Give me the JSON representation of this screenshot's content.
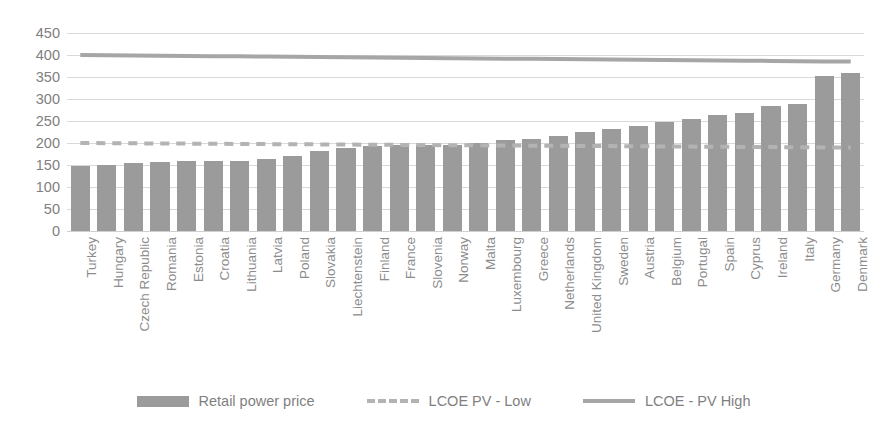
{
  "chart_data": {
    "type": "bar",
    "title": "",
    "subtitle": "",
    "xlabel": "",
    "ylabel": "",
    "ylim": [
      0,
      450
    ],
    "ytick_step": 50,
    "yticks": [
      450,
      400,
      350,
      300,
      250,
      200,
      150,
      100,
      50,
      0
    ],
    "grid": true,
    "legend_position": "bottom",
    "categories": [
      "Turkey",
      "Hungary",
      "Czech Republic",
      "Romania",
      "Estonia",
      "Croatia",
      "Lithuania",
      "Latvia",
      "Poland",
      "Slovakia",
      "Liechtenstein",
      "Finland",
      "France",
      "Slovenia",
      "Norway",
      "Malta",
      "Luxembourg",
      "Greece",
      "Netherlands",
      "United Kingdom",
      "Sweden",
      "Austria",
      "Belgium",
      "Portugal",
      "Spain",
      "Cyprus",
      "Ireland",
      "Italy",
      "Germany",
      "Denmark"
    ],
    "series": [
      {
        "name": "Retail power price",
        "type": "bar",
        "color": "#9b9b9b",
        "values": [
          147,
          149,
          155,
          157,
          158,
          158,
          160,
          163,
          171,
          181,
          188,
          193,
          196,
          196,
          196,
          199,
          206,
          209,
          215,
          224,
          231,
          239,
          248,
          255,
          264,
          268,
          284,
          288,
          352,
          358
        ]
      },
      {
        "name": "LCOE PV - Low",
        "type": "line",
        "style": "dashed",
        "color": "#b3b3b3",
        "values": [
          200,
          199.6,
          199.3,
          198.9,
          198.6,
          198.2,
          197.9,
          197.5,
          197.2,
          196.8,
          196.4,
          196.1,
          195.7,
          195.4,
          195.0,
          194.7,
          194.3,
          193.9,
          193.6,
          193.2,
          192.9,
          192.5,
          192.2,
          191.8,
          191.4,
          191.1,
          190.7,
          190.4,
          190.0,
          189.7
        ]
      },
      {
        "name": "LCOE - PV High",
        "type": "line",
        "style": "solid",
        "color": "#a6a6a6",
        "values": [
          400,
          399.5,
          399.0,
          398.4,
          397.9,
          397.4,
          396.9,
          396.4,
          395.9,
          395.3,
          394.8,
          394.3,
          393.8,
          393.3,
          392.8,
          392.2,
          391.7,
          391.2,
          390.7,
          390.2,
          389.7,
          389.1,
          388.6,
          388.1,
          387.6,
          387.1,
          386.6,
          386.0,
          385.5,
          385.0
        ]
      }
    ]
  },
  "legend": {
    "items": [
      {
        "label": "Retail power price",
        "marker": "bar-swatch-icon"
      },
      {
        "label": "LCOE PV - Low",
        "marker": "dashed-line-icon"
      },
      {
        "label": "LCOE - PV High",
        "marker": "solid-line-icon"
      }
    ]
  },
  "colors": {
    "bar": "#9b9b9b",
    "lcoe_low": "#b3b3b3",
    "lcoe_high": "#a6a6a6",
    "gridline": "#d9d9d9",
    "tick_text": "#808080",
    "category_text": "#8c8c8c",
    "background": "#ffffff"
  }
}
